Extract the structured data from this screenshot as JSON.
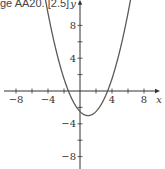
{
  "caption": "ge AA20. [2.5]",
  "chart_data": {
    "type": "line",
    "title": "",
    "xlabel": "x",
    "ylabel": "y",
    "xlim": [
      -9.5,
      10
    ],
    "ylim": [
      -9.5,
      11
    ],
    "x_ticks": [
      -8,
      -4,
      4,
      8
    ],
    "y_ticks": [
      8,
      4,
      -4,
      -8
    ],
    "x_minor_ticks": [
      -8,
      -6,
      -4,
      -2,
      2,
      4,
      6,
      8
    ],
    "y_minor_ticks": [
      8,
      6,
      4,
      2,
      -2,
      -4,
      -6,
      -8
    ],
    "grid": false,
    "series": [
      {
        "name": "parabola",
        "equation_estimate": "y = 0.5(x - 1)^2 - 3",
        "vertex": [
          1,
          -3
        ],
        "roots": [
          -1.45,
          3.45
        ],
        "y_intercept": -2.5,
        "x": [
          -4.3,
          -4,
          -3,
          -2,
          -1.45,
          -1,
          0,
          1,
          2,
          3,
          3.45,
          4,
          5,
          6,
          6.3
        ],
        "y": [
          9.5,
          9.5,
          5,
          1.5,
          0,
          -1,
          -2.5,
          -3,
          -2.5,
          -1,
          0,
          1.5,
          5,
          9.5,
          11
        ],
        "color": "#555555"
      }
    ]
  }
}
